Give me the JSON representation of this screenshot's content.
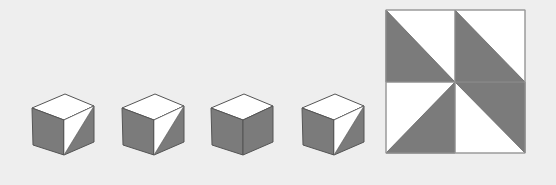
{
  "colors": {
    "background": "#eeeeee",
    "dark": "#7b7b7b",
    "light": "#ffffff",
    "stroke": "#555555",
    "frame": "#9a9a9a"
  },
  "cubes": [
    {
      "id": "cube-1",
      "right_face": "split"
    },
    {
      "id": "cube-2",
      "right_face": "split"
    },
    {
      "id": "cube-3",
      "right_face": "solid"
    },
    {
      "id": "cube-4",
      "right_face": "split"
    }
  ],
  "square": {
    "quadrants": [
      {
        "position": "top-left",
        "shaded": "lower-left"
      },
      {
        "position": "top-right",
        "shaded": "lower-left"
      },
      {
        "position": "bottom-left",
        "shaded": "lower-right"
      },
      {
        "position": "bottom-right",
        "shaded": "upper-right"
      }
    ]
  }
}
